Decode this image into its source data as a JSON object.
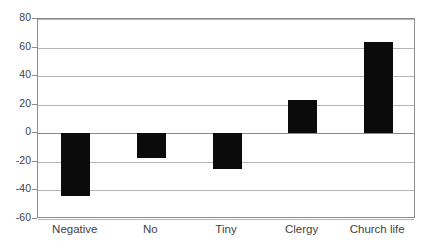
{
  "chart_data": {
    "type": "bar",
    "title": "",
    "subtitle": "",
    "xlabel": "",
    "ylabel": "",
    "categories": [
      "Negative",
      "No",
      "Tiny",
      "Clergy",
      "Church life"
    ],
    "values": [
      -44,
      -17,
      -25,
      23,
      64
    ],
    "series": [
      {
        "name": "Series 1",
        "values": [
          -44,
          -17,
          -25,
          23,
          64
        ],
        "color": "#0b0b0b"
      }
    ],
    "ylim": [
      -60,
      80
    ],
    "ytick_labels": [
      "80",
      "60",
      "40",
      "20",
      "0",
      "-20",
      "-40",
      "-60"
    ],
    "ytick_values": [
      80,
      60,
      40,
      20,
      0,
      -20,
      -40,
      -60
    ],
    "ytick_step": 20,
    "grid": true,
    "grid_axis": "y",
    "grid_color": "#b4b4b4",
    "zero_line": 0,
    "legend": false,
    "legend_position": "none",
    "plot_border_color": "#8c8c8c",
    "background_color": "#ffffff",
    "bar_color": "#0b0b0b",
    "annotations": []
  },
  "figure": {
    "title_remnant": ""
  }
}
